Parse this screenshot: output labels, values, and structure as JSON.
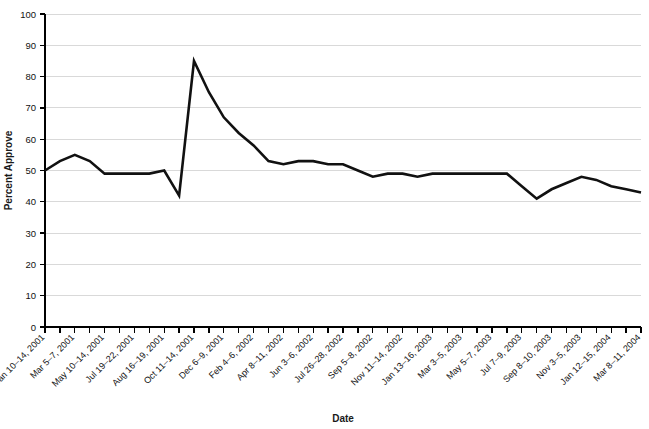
{
  "chart_data": {
    "type": "line",
    "title": "",
    "xlabel": "Date",
    "ylabel": "Percent Approve",
    "ylim": [
      0,
      100
    ],
    "ytick_step": 10,
    "yticks": [
      0,
      10,
      20,
      30,
      40,
      50,
      60,
      70,
      80,
      90,
      100
    ],
    "grid": true,
    "legend": "none",
    "line_color": "#111111",
    "grid_color": "#d9d9d9",
    "axis_color": "#000000",
    "categories": [
      "Jan 10–14, 2001",
      "Feb 9–11, 2001",
      "Mar 5–7, 2001",
      "Apr 6–8, 2001",
      "May 10–14, 2001",
      "Jun 8–10, 2001",
      "Jul 19–22, 2001",
      "Aug 3–5, 2001",
      "Aug 16–19, 2001",
      "Sep 7–10, 2001",
      "Oct 11–14, 2001",
      "Nov 8–11, 2001",
      "Dec 6–9, 2001",
      "Jan 11–14, 2002",
      "Feb 4–6, 2002",
      "Mar 8–10, 2002",
      "Apr 8–11, 2002",
      "May 6–9, 2002",
      "Jun 3–6, 2002",
      "Jul 5–8, 2002",
      "Jul 26–28, 2002",
      "Aug 19–21, 2002",
      "Sep 5–8, 2002",
      "Oct 3–6, 2002",
      "Nov 11–14, 2002",
      "Dec 9–10, 2002",
      "Jan 13–16, 2003",
      "Feb 3–6, 2003",
      "Mar 3–5, 2003",
      "Apr 7–9, 2003",
      "May 5–7, 2003",
      "Jun 9–10, 2003",
      "Jul 7–9, 2003",
      "Aug 4–6, 2003",
      "Sep 8–10, 2003",
      "Oct 6–8, 2003",
      "Nov 3–5, 2003",
      "Dec 11–14, 2003",
      "Jan 12–15, 2004",
      "Feb 9–12, 2004",
      "Mar 8–11, 2004"
    ],
    "labeled_categories": [
      "Jan 10–14, 2001",
      "Mar 5–7, 2001",
      "May 10–14, 2001",
      "Jul 19–22, 2001",
      "Aug 16–19, 2001",
      "Oct 11–14, 2001",
      "Dec 6–9, 2001",
      "Feb 4–6, 2002",
      "Apr 8–11, 2002",
      "Jun 3–6, 2002",
      "Jul 26–28, 2002",
      "Sep 5–8, 2002",
      "Nov 11–14, 2002",
      "Jan 13–16, 2003",
      "Mar 3–5, 2003",
      "May 5–7, 2003",
      "Jul 7–9, 2003",
      "Sep 8–10, 2003",
      "Nov 3–5, 2003",
      "Jan 12–15, 2004",
      "Mar 8–11, 2004"
    ],
    "values": [
      50,
      53,
      55,
      53,
      49,
      49,
      49,
      49,
      50,
      42,
      85,
      75,
      67,
      62,
      58,
      53,
      52,
      53,
      53,
      52,
      52,
      50,
      48,
      49,
      49,
      48,
      49,
      49,
      49,
      49,
      49,
      49,
      45,
      41,
      44,
      46,
      48,
      47,
      45,
      44,
      43
    ],
    "annotations": []
  }
}
